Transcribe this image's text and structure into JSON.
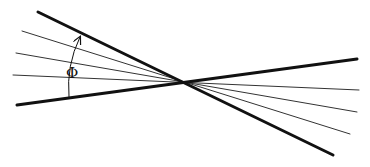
{
  "diagram": {
    "title": "",
    "angle_label": "Φ",
    "colors": {
      "line": "#111111",
      "background": "#ffffff"
    },
    "intersection": {
      "x": 183,
      "y": 82
    },
    "thick_lines": [
      {
        "name": "upper-boundary-line",
        "x1": 38,
        "y1": 12,
        "x2": 333,
        "y2": 155
      },
      {
        "name": "lower-boundary-line",
        "x1": 17,
        "y1": 105,
        "x2": 357,
        "y2": 59
      }
    ],
    "thin_lines": [
      {
        "name": "ray-1",
        "x1": 22,
        "y1": 31,
        "x2": 350,
        "y2": 134
      },
      {
        "name": "ray-2",
        "x1": 16,
        "y1": 53,
        "x2": 357,
        "y2": 112
      },
      {
        "name": "ray-3",
        "x1": 13,
        "y1": 75,
        "x2": 359,
        "y2": 90
      }
    ],
    "arc": {
      "start": {
        "x": 69,
        "y": 97
      },
      "end": {
        "x": 80,
        "y": 37
      }
    }
  }
}
